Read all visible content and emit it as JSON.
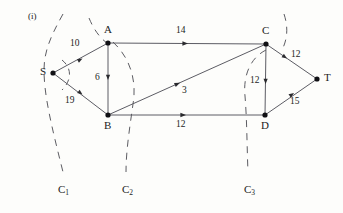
{
  "figure": {
    "part_label": "(i)",
    "type": "flow-network-with-cuts",
    "nodes": [
      {
        "id": "S",
        "label": "S",
        "x": 53,
        "y": 73,
        "label_dx": -11,
        "label_dy": -6
      },
      {
        "id": "A",
        "label": "A",
        "x": 108,
        "y": 43,
        "label_dx": -3,
        "label_dy": -18
      },
      {
        "id": "B",
        "label": "B",
        "x": 108,
        "y": 115,
        "label_dx": -3,
        "label_dy": 7
      },
      {
        "id": "C",
        "label": "C",
        "x": 266,
        "y": 44,
        "label_dx": -3,
        "label_dy": -18
      },
      {
        "id": "D",
        "label": "D",
        "x": 265,
        "y": 115,
        "label_dx": -3,
        "label_dy": 7
      },
      {
        "id": "T",
        "label": "T",
        "x": 317,
        "y": 79,
        "label_dx": 6,
        "label_dy": -6
      }
    ],
    "edges": [
      {
        "from": "S",
        "to": "A",
        "capacity": "10",
        "label_x": 74,
        "label_y": 43
      },
      {
        "from": "S",
        "to": "B",
        "capacity": "19",
        "label_x": 69,
        "label_y": 100
      },
      {
        "from": "A",
        "to": "B",
        "capacity": "6",
        "label_x": 97,
        "label_y": 76
      },
      {
        "from": "A",
        "to": "C",
        "capacity": "14",
        "label_x": 180,
        "label_y": 30
      },
      {
        "from": "B",
        "to": "C",
        "capacity": "3",
        "label_x": 184,
        "label_y": 89
      },
      {
        "from": "B",
        "to": "D",
        "capacity": "12",
        "label_x": 180,
        "label_y": 124
      },
      {
        "from": "C",
        "to": "D",
        "capacity": "12",
        "label_x": 252,
        "label_y": 79
      },
      {
        "from": "C",
        "to": "T",
        "capacity": "12",
        "label_x": 294,
        "label_y": 54
      },
      {
        "from": "D",
        "to": "T",
        "capacity": "15",
        "label_x": 293,
        "label_y": 101
      }
    ],
    "cuts": [
      {
        "id": "C1",
        "label": "C",
        "subscript": "1",
        "label_x": 59,
        "label_y": 190
      },
      {
        "id": "C2",
        "label": "C",
        "subscript": "2",
        "label_x": 125,
        "label_y": 190
      },
      {
        "id": "C3",
        "label": "C",
        "subscript": "3",
        "label_x": 245,
        "label_y": 190
      }
    ],
    "colors": {
      "ink": "#1c1c1c",
      "edge": "#4a4a52",
      "dashed": "#5c5c62",
      "background": "#fdfdfb"
    }
  }
}
